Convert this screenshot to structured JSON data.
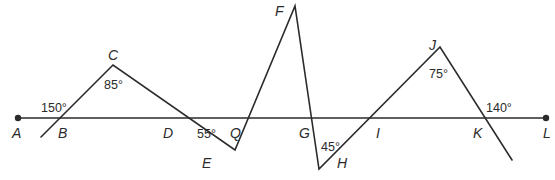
{
  "diagram": {
    "type": "geometry",
    "colors": {
      "line": "#2b2b2b",
      "background": "#ffffff"
    },
    "points": {
      "A": "A",
      "B": "B",
      "C": "C",
      "D": "D",
      "E": "E",
      "F": "F",
      "G": "G",
      "H": "H",
      "I": "I",
      "J": "J",
      "K": "K",
      "L": "L",
      "Q": "Q"
    },
    "angles": {
      "exterior_at_B": "150°",
      "at_C": "85°",
      "at_E": "55°",
      "at_H": "45°",
      "at_J": "75°",
      "exterior_at_K": "140°"
    }
  }
}
